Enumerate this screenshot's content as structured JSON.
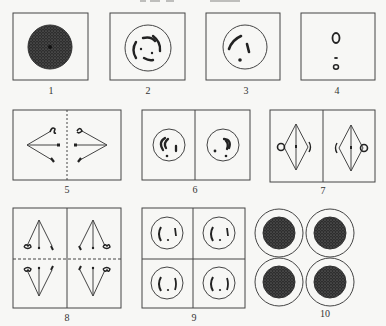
{
  "figure": {
    "panels": [
      {
        "id": 1,
        "label": "1",
        "content": "dense stippled nucleus"
      },
      {
        "id": 2,
        "label": "2",
        "content": "nucleus with several curved chromosome threads"
      },
      {
        "id": 3,
        "label": "3",
        "content": "nucleus with two chromosome segments and a dot"
      },
      {
        "id": 4,
        "label": "4",
        "content": "small ring and dots aligned vertically"
      },
      {
        "id": 5,
        "label": "5",
        "content": "two spindles separating chromosomes, dashed midline"
      },
      {
        "id": 6,
        "label": "6",
        "content": "two daughter nuclei with chromosomes"
      },
      {
        "id": 7,
        "label": "7",
        "content": "two diamond spindles with chromosomes at equator"
      },
      {
        "id": 8,
        "label": "8",
        "content": "four spindles, chromosomes moving to poles, dashed midline"
      },
      {
        "id": 9,
        "label": "9",
        "content": "four nuclei with chromosome segments"
      },
      {
        "id": 10,
        "label": "10",
        "content": "four ringed cells with dense nuclei (tetrad)"
      }
    ]
  },
  "colors": {
    "background": "#f7f7f5",
    "line": "#444444",
    "ink": "#2a2a2a",
    "stipple": "#3a3a3a"
  }
}
